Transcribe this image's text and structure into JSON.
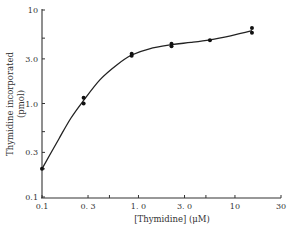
{
  "chart_data": {
    "type": "line",
    "title": "",
    "xlabel": "[Thymidine] (μM)",
    "ylabel_line1": "Thymidine incorporated",
    "ylabel_line2": "(pmol)",
    "xscale": "log",
    "yscale": "log",
    "xlim": [
      0.1,
      30
    ],
    "ylim": [
      0.1,
      10
    ],
    "x_ticks": [
      {
        "value": 0.1,
        "label": "0.1"
      },
      {
        "value": 0.3,
        "label": "0. 3"
      },
      {
        "value": 0.5,
        "label": ""
      },
      {
        "value": 1.0,
        "label": "1. 0"
      },
      {
        "value": 3.0,
        "label": "3. 0"
      },
      {
        "value": 5.0,
        "label": ""
      },
      {
        "value": 10,
        "label": "10"
      },
      {
        "value": 30,
        "label": "30"
      }
    ],
    "y_ticks": [
      {
        "value": 0.1,
        "label": "0.1"
      },
      {
        "value": 0.2,
        "label": ""
      },
      {
        "value": 0.3,
        "label": "0.3"
      },
      {
        "value": 0.5,
        "label": ""
      },
      {
        "value": 1.0,
        "label": "1.0"
      },
      {
        "value": 3.0,
        "label": "3.0"
      },
      {
        "value": 5.0,
        "label": ""
      },
      {
        "value": 10,
        "label": "10"
      }
    ],
    "grid": false,
    "series": [
      {
        "name": "Thymidine incorporation",
        "points": [
          {
            "x": 0.1,
            "y": 0.2
          },
          {
            "x": 0.27,
            "y": 1.15
          },
          {
            "x": 0.27,
            "y": 1.0
          },
          {
            "x": 0.85,
            "y": 3.4
          },
          {
            "x": 0.85,
            "y": 3.25
          },
          {
            "x": 2.2,
            "y": 4.35
          },
          {
            "x": 2.2,
            "y": 4.1
          },
          {
            "x": 5.5,
            "y": 4.75
          },
          {
            "x": 15,
            "y": 6.4
          },
          {
            "x": 15,
            "y": 5.7
          }
        ],
        "curve": [
          {
            "x": 0.1,
            "y": 0.2
          },
          {
            "x": 0.15,
            "y": 0.42
          },
          {
            "x": 0.2,
            "y": 0.7
          },
          {
            "x": 0.27,
            "y": 1.08
          },
          {
            "x": 0.4,
            "y": 1.8
          },
          {
            "x": 0.6,
            "y": 2.6
          },
          {
            "x": 0.85,
            "y": 3.3
          },
          {
            "x": 1.3,
            "y": 3.85
          },
          {
            "x": 2.2,
            "y": 4.25
          },
          {
            "x": 3.5,
            "y": 4.5
          },
          {
            "x": 5.5,
            "y": 4.8
          },
          {
            "x": 9,
            "y": 5.3
          },
          {
            "x": 15,
            "y": 6.0
          }
        ]
      }
    ]
  }
}
